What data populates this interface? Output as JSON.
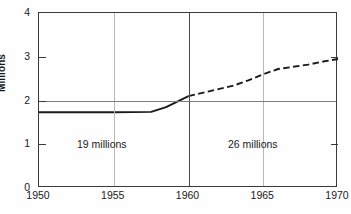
{
  "chart_data": {
    "type": "line",
    "title": "",
    "xlabel": "",
    "ylabel": "Millions",
    "xlim": [
      1950,
      1970
    ],
    "ylim": [
      0,
      4
    ],
    "xticks": [
      1950,
      1955,
      1960,
      1965,
      1970
    ],
    "yticks": [
      0,
      1,
      2,
      3,
      4
    ],
    "grid": {
      "horizontal_at": [
        2
      ],
      "vertical_at": [
        1955,
        1960,
        1965
      ],
      "vertical_major": [
        1960
      ],
      "vertical_minor": [
        1955,
        1965
      ]
    },
    "legend": null,
    "legend_position": "none",
    "series": [
      {
        "name": "Actual",
        "style": "solid",
        "color": "#1a1a1a",
        "x": [
          1950,
          1952,
          1955,
          1957.5,
          1958.5,
          1960
        ],
        "values": [
          1.73,
          1.73,
          1.73,
          1.74,
          1.85,
          2.1
        ]
      },
      {
        "name": "Projected",
        "style": "dashed",
        "color": "#1a1a1a",
        "x": [
          1960,
          1961,
          1962,
          1963,
          1964,
          1965,
          1966,
          1967,
          1968,
          1969,
          1970
        ],
        "values": [
          2.1,
          2.18,
          2.26,
          2.34,
          2.46,
          2.6,
          2.72,
          2.77,
          2.82,
          2.89,
          2.95
        ]
      }
    ],
    "annotations": [
      {
        "text": "19 millions",
        "x": 1954.2,
        "y": 1.0
      },
      {
        "text": "26 millions",
        "x": 1964.3,
        "y": 1.0
      }
    ],
    "ytick_labels": [
      "0",
      "1",
      "2",
      "3",
      "4"
    ],
    "xtick_labels": [
      "1950",
      "1955",
      "1960",
      "1965",
      "1970"
    ]
  },
  "axis": {
    "y_title": "Millions"
  }
}
